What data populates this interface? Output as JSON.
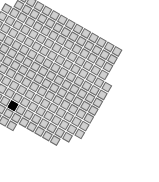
{
  "figure": {
    "cell_color": "#cfcfcf",
    "edge_color": "#6a6a6a",
    "highlight_color": "#000000",
    "rotation_deg": 30,
    "cell_pitch_px": 9,
    "origin": [
      22,
      -8
    ],
    "rows": [
      {
        "r": 0,
        "start": 0,
        "count": 13
      },
      {
        "r": 1,
        "start": 0,
        "count": 13
      },
      {
        "r": 2,
        "start": -1,
        "count": 14
      },
      {
        "r": 3,
        "start": -1,
        "count": 14
      },
      {
        "r": 4,
        "start": -1,
        "count": 15
      },
      {
        "r": 5,
        "start": -2,
        "count": 16
      },
      {
        "r": 6,
        "start": -2,
        "count": 16
      },
      {
        "r": 7,
        "start": -2,
        "count": 16
      },
      {
        "r": 8,
        "start": -3,
        "count": 17
      },
      {
        "r": 9,
        "start": -3,
        "count": 17
      },
      {
        "r": 10,
        "start": -3,
        "count": 17
      },
      {
        "r": 11,
        "start": -3,
        "count": 16
      },
      {
        "r": 12,
        "start": -2,
        "count": 14
      },
      {
        "r": 13,
        "start": -1,
        "count": 8
      },
      {
        "r": 14,
        "start": 0,
        "count": 5
      },
      {
        "r": 15,
        "start": 1,
        "count": 2
      }
    ],
    "highlighted": [
      {
        "r": 11,
        "c": 5
      }
    ]
  }
}
